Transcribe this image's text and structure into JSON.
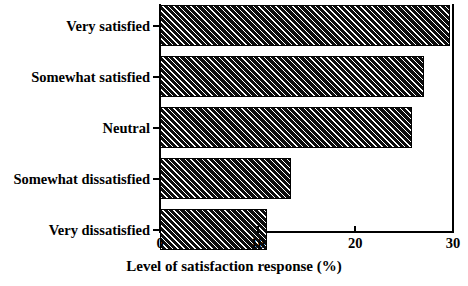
{
  "chart_data": {
    "type": "bar",
    "orientation": "horizontal",
    "title": "",
    "xlabel": "Level of satisfaction response (%)",
    "ylabel": "",
    "categories": [
      "Very satisfied",
      "Somewhat satisfied",
      "Neutral",
      "Somewhat dissatisfied",
      "Very dissatisfied"
    ],
    "values": [
      29.7,
      27.0,
      25.8,
      13.4,
      11.0
    ],
    "xlim": [
      0,
      30
    ],
    "xticks": [
      0,
      10,
      20,
      30
    ],
    "xticklabels": [
      "0",
      "10",
      "20",
      "30"
    ],
    "grid": false,
    "legend": null,
    "bar_style": {
      "fill": "#111111",
      "hatch": "diagonal-lines",
      "edge": "#000000"
    }
  },
  "axis": {
    "x_title": "Level of satisfaction response (%)",
    "tick_labels": [
      "0",
      "10",
      "20",
      "30"
    ]
  },
  "bars": [
    {
      "label": "Very satisfied",
      "value": 29.7
    },
    {
      "label": "Somewhat satisfied",
      "value": 27.0
    },
    {
      "label": "Neutral",
      "value": 25.8
    },
    {
      "label": "Somewhat dissatisfied",
      "value": 13.4
    },
    {
      "label": "Very dissatisfied",
      "value": 11.0
    }
  ]
}
